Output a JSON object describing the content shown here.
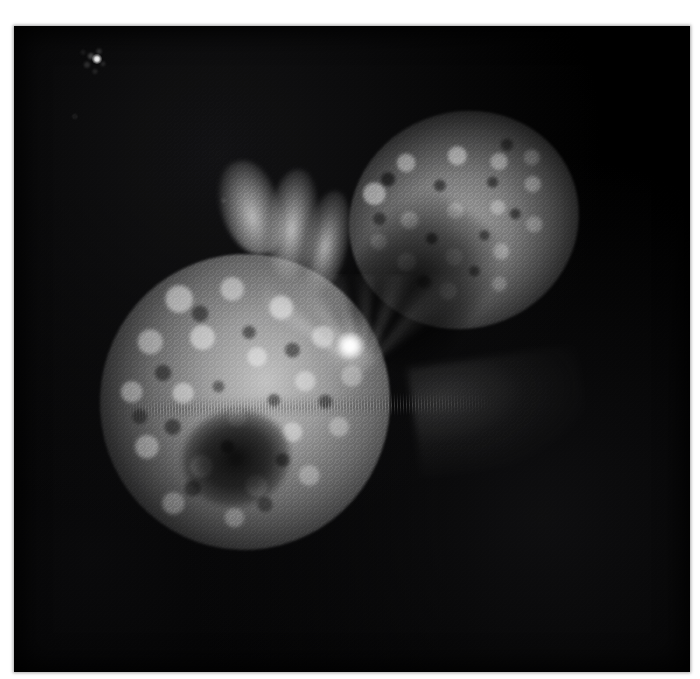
{
  "image": {
    "kind": "astronomical-photograph",
    "subject": "bipolar nebula with twin expanding lobes and a bright central stellar source",
    "background_color": "#000000",
    "page_background_color": "#ffffff",
    "plate": {
      "x": 14,
      "y": 26,
      "width": 676,
      "height": 646
    },
    "caption": ""
  },
  "features": {
    "ne_lobe": {
      "name": "northeast-lobe",
      "center_x": 464,
      "center_y": 220,
      "radius_x": 116,
      "radius_y": 108,
      "rotation_deg": -22,
      "peak_brightness": "#b9b9b9",
      "texture": "mottled cauliflower clumps"
    },
    "sw_lobe": {
      "name": "southwest-lobe",
      "center_x": 245,
      "center_y": 402,
      "radius_x": 145,
      "radius_y": 148,
      "rotation_deg": 8,
      "peak_brightness": "#cdcdcd",
      "texture": "bubbly knotted clumps with dark interior cavity"
    },
    "central_source": {
      "name": "central-bright-source",
      "x": 350,
      "y": 346,
      "size": 30,
      "color": "#ffffff"
    },
    "field_star": {
      "name": "foreground-field-star",
      "x": 97,
      "y": 59,
      "size": 10,
      "color": "#ffffff"
    },
    "equatorial_skirt": {
      "name": "equatorial-skirt",
      "y": 406,
      "x_start": 118,
      "x_end": 498,
      "appearance": "thin horizontal striated band"
    },
    "polar_plumes": [
      {
        "name": "plume-a",
        "x": 250,
        "y": 208
      },
      {
        "name": "plume-b",
        "x": 292,
        "y": 224
      },
      {
        "name": "plume-c",
        "x": 326,
        "y": 242
      }
    ],
    "dark_lane": {
      "name": "inter-lobe-dark-lane",
      "x": 418,
      "y": 282,
      "rotation_deg": 34
    }
  },
  "palette": {
    "sky": "#000000",
    "lobe_bright": "#e0e0e0",
    "lobe_mid": "#9a9a9a",
    "lobe_dim": "#4a4a4a",
    "core": "#ffffff",
    "margin": "#ffffff"
  }
}
